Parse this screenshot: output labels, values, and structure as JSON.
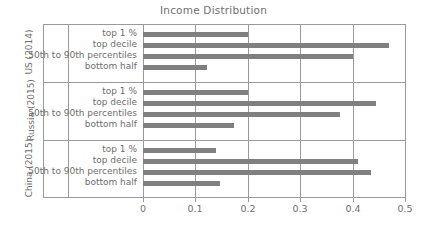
{
  "chart_data": {
    "type": "bar",
    "orientation": "horizontal",
    "title": "Income Distribution",
    "xlabel": "",
    "ylabel": "",
    "xlim": [
      0,
      0.5
    ],
    "xticks": [
      "0",
      "0.1",
      "0.2",
      "0.3",
      "0.4",
      "0.5"
    ],
    "xtick_values": [
      0,
      0.1,
      0.2,
      0.3,
      0.4,
      0.5
    ],
    "grid": true,
    "grid_axis": "x",
    "legend": false,
    "bar_color": "#808080",
    "categories": [
      "top 1 %",
      "top decile",
      "50th to 90th percentiles",
      "bottom half"
    ],
    "groups": [
      {
        "name": "US (2014)",
        "rows": [
          {
            "label": "top 1 %",
            "value": 0.2
          },
          {
            "label": "top decile",
            "value": 0.47
          },
          {
            "label": "50th to 90th percentiles",
            "value": 0.4
          },
          {
            "label": "bottom half",
            "value": 0.122
          }
        ]
      },
      {
        "name": "Russia (2015)",
        "rows": [
          {
            "label": "top 1 %",
            "value": 0.2
          },
          {
            "label": "top decile",
            "value": 0.445
          },
          {
            "label": "50th to 90th percentiles",
            "value": 0.375
          },
          {
            "label": "bottom half",
            "value": 0.173
          }
        ]
      },
      {
        "name": "China (2015)",
        "rows": [
          {
            "label": "top 1 %",
            "value": 0.14
          },
          {
            "label": "top decile",
            "value": 0.41
          },
          {
            "label": "50th to 90th percentiles",
            "value": 0.435
          },
          {
            "label": "bottom half",
            "value": 0.147
          }
        ]
      }
    ]
  },
  "axis": {
    "x_start_px": 143,
    "x_end_px": 405,
    "plot_top_px": 24,
    "plot_bottom_px": 198
  },
  "colors": {
    "bar": "#808080",
    "axis": "#9a9a9a",
    "text": "#6e6e6e",
    "background": "#ffffff"
  }
}
